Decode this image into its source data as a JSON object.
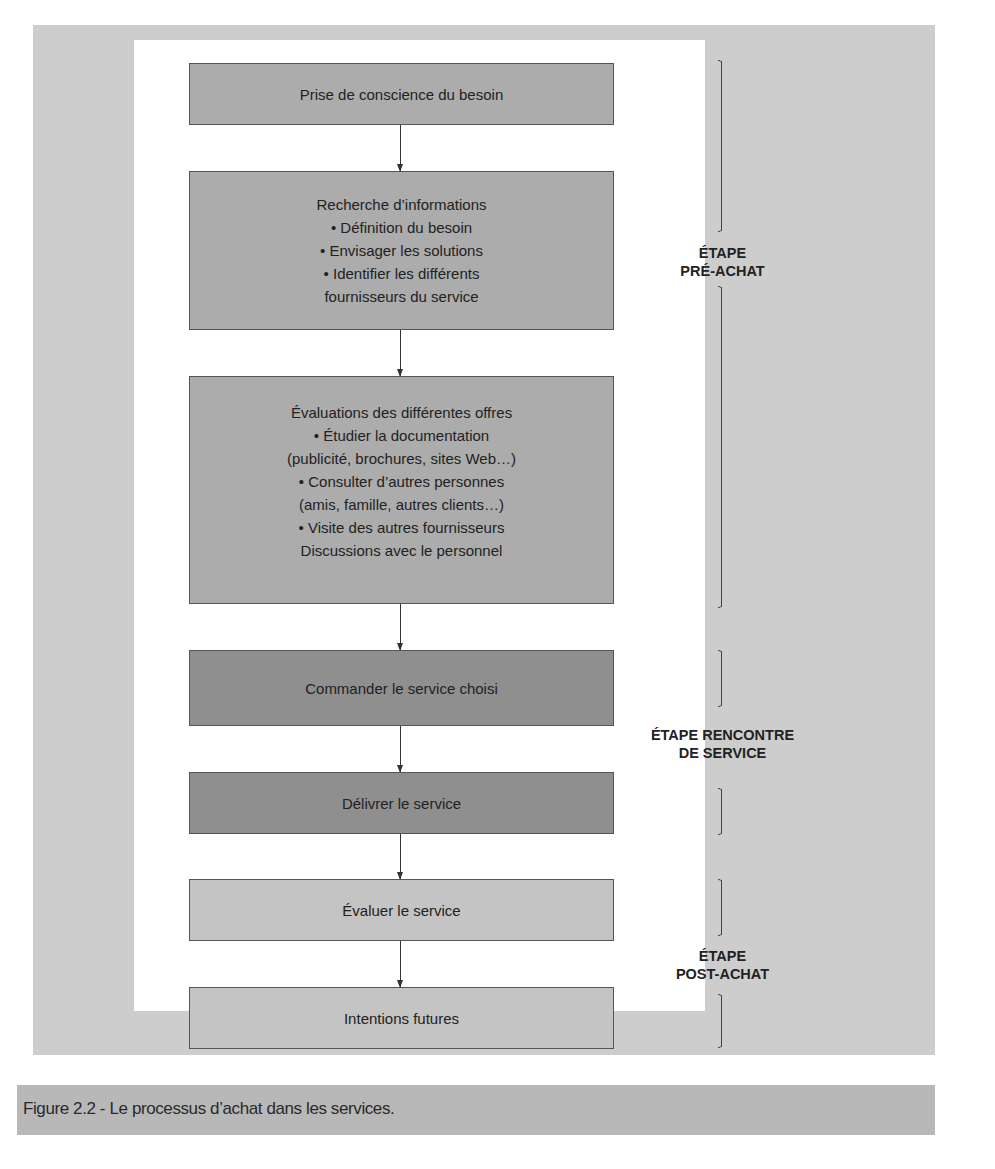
{
  "figure": {
    "caption": "Figure 2.2 - Le processus d’achat dans les services."
  },
  "steps": [
    {
      "title": "Prise de conscience du besoin",
      "lines": []
    },
    {
      "title": "Recherche d’informations",
      "lines": [
        "• Définition du besoin",
        "• Envisager les solutions",
        "• Identifier les différents",
        "fournisseurs du service"
      ]
    },
    {
      "title": "Évaluations des différentes offres",
      "lines": [
        "• Étudier la documentation",
        "(publicité, brochures, sites Web…)",
        "• Consulter d’autres personnes",
        "(amis, famille, autres clients…)",
        "• Visite des autres fournisseurs",
        "Discussions avec le personnel"
      ]
    },
    {
      "title": "Commander le service choisi",
      "lines": []
    },
    {
      "title": "Délivrer le service",
      "lines": []
    },
    {
      "title": "Évaluer le service",
      "lines": []
    },
    {
      "title": "Intentions futures",
      "lines": []
    }
  ],
  "stages": [
    {
      "line1": "ÉTAPE",
      "line2": "PRÉ-ACHAT"
    },
    {
      "line1": "ÉTAPE RENCONTRE",
      "line2": "DE SERVICE"
    },
    {
      "line1": "ÉTAPE",
      "line2": "POST-ACHAT"
    }
  ],
  "colors": {
    "pre_purchase_box": "#acacac",
    "service_encounter_box": "#8f8f8f",
    "post_purchase_box": "#c4c4c4",
    "frame_background": "#cdcdcd",
    "caption_bar": "#b8b8b8"
  }
}
